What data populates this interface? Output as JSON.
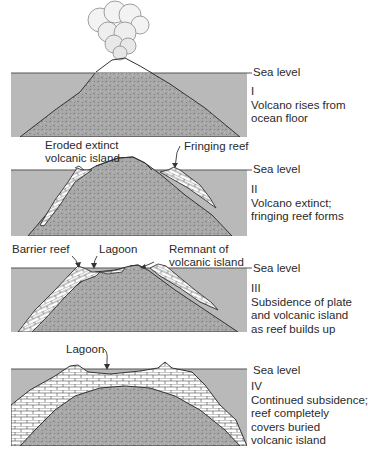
{
  "colors": {
    "water": "#b9b9b9",
    "rock": "#a9a9a9",
    "reef": "#ffffff",
    "outline": "#333333",
    "text": "#2a2a2a"
  },
  "stages": [
    {
      "numeral": "I",
      "sea_level_label": "Sea level",
      "description": [
        "Volcano rises from",
        "ocean floor"
      ],
      "callouts": []
    },
    {
      "numeral": "II",
      "sea_level_label": "Sea level",
      "description": [
        "Volcano extinct;",
        "fringing reef forms"
      ],
      "callouts": [
        {
          "text": [
            "Eroded extinct",
            "volcanic island"
          ]
        },
        {
          "text": [
            "Fringing reef"
          ]
        }
      ]
    },
    {
      "numeral": "III",
      "sea_level_label": "Sea level",
      "description": [
        "Subsidence of plate",
        "and volcanic island",
        "as reef builds up"
      ],
      "callouts": [
        {
          "text": [
            "Barrier reef"
          ]
        },
        {
          "text": [
            "Lagoon"
          ]
        },
        {
          "text": [
            "Remnant of",
            "volcanic island"
          ]
        }
      ]
    },
    {
      "numeral": "IV",
      "sea_level_label": "Sea level",
      "description": [
        "Continued subsidence;",
        "reef completely",
        "covers buried",
        "volcanic island"
      ],
      "callouts": [
        {
          "text": [
            "Lagoon"
          ]
        }
      ]
    }
  ]
}
